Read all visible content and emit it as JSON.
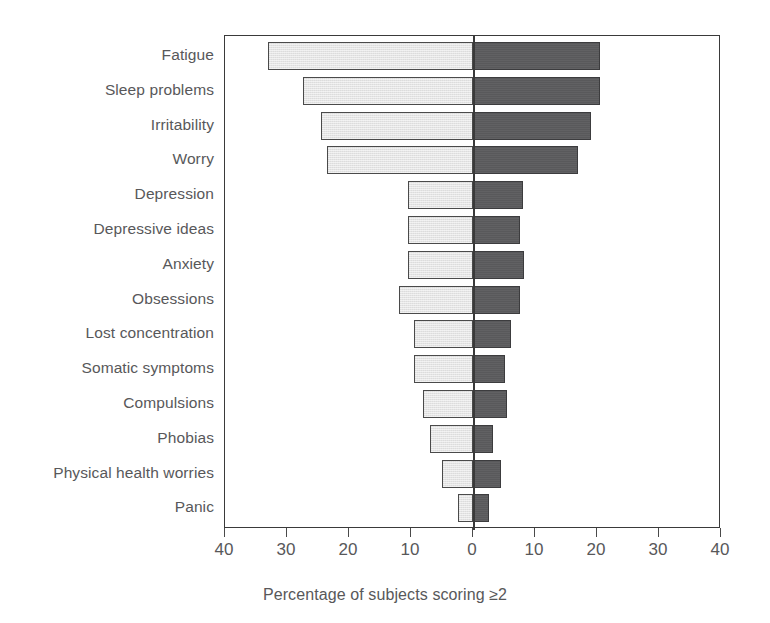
{
  "chart_data": {
    "type": "bar",
    "orientation": "horizontal-diverging",
    "title": "",
    "subtitle": "",
    "xlabel": "Percentage of subjects scoring ≥2",
    "ylabel": "",
    "xlim": [
      -40,
      40
    ],
    "xticks": [
      40,
      30,
      20,
      10,
      0,
      10,
      20,
      30,
      40
    ],
    "grid": false,
    "legend": "none",
    "categories": [
      "Fatigue",
      "Sleep problems",
      "Irritability",
      "Worry",
      "Depression",
      "Depressive ideas",
      "Anxiety",
      "Obsessions",
      "Lost concentration",
      "Somatic symptoms",
      "Compulsions",
      "Phobias",
      "Physical health worries",
      "Panic"
    ],
    "series": [
      {
        "name": "left",
        "side": "left",
        "color": "#e4e4e4",
        "values": [
          33,
          27.5,
          24.5,
          23.5,
          10.5,
          10.5,
          10.5,
          12,
          9.5,
          9.5,
          8,
          7,
          5,
          2.5
        ]
      },
      {
        "name": "right",
        "side": "right",
        "color": "#59595b",
        "values": [
          20.5,
          20.5,
          19,
          17,
          8,
          7.5,
          8.2,
          7.5,
          6.2,
          5.2,
          5.5,
          3.2,
          4.5,
          2.5
        ]
      }
    ]
  },
  "axis": {
    "caption": "Percentage of subjects scoring ≥2",
    "tick_labels": [
      "40",
      "30",
      "20",
      "10",
      "0",
      "10",
      "20",
      "30",
      "40"
    ]
  }
}
